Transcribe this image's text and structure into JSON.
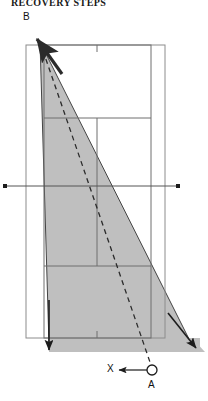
{
  "title": "RECOVERY STEPS",
  "labels": {
    "apex": "B",
    "pivot": "A",
    "axis_direction": "X"
  },
  "colors": {
    "shaded_fill": "#bfbfbf",
    "outline": "#3a3a3a",
    "thin_rule": "#8c8c8c",
    "dashed": "#2b2b2b",
    "text": "#111111"
  },
  "diagram": {
    "type": "tipping-geometry",
    "outer_rect": {
      "x1": 26,
      "y1": 45,
      "x2": 165,
      "y2": 338
    },
    "inner_rect": {
      "x1": 44,
      "y1": 45,
      "x2": 151,
      "y2": 338
    },
    "horizontal_dividers": [
      118,
      266
    ],
    "vertical_divider": 97,
    "tick_marks": [
      {
        "x": 97,
        "y": 45,
        "len": 6,
        "dir": "down"
      },
      {
        "x": 97,
        "y": 338,
        "len": 6,
        "dir": "up"
      }
    ],
    "axis_line": {
      "y": 186,
      "x1": 5,
      "x2": 178,
      "endpoint_style": "square-dot"
    },
    "shaded_triangle": [
      [
        40,
        42
      ],
      [
        49,
        345
      ],
      [
        192,
        345
      ]
    ],
    "bottom_band": {
      "x1": 49,
      "y1": 338,
      "x2": 200,
      "y2": 352
    },
    "dashed_path": [
      [
        40,
        42
      ],
      [
        152,
        370
      ]
    ],
    "pivot_circle": {
      "cx": 152,
      "cy": 370,
      "r": 5
    },
    "arrows": [
      {
        "name": "apex-arrow",
        "from": [
          60,
          70
        ],
        "to": [
          36,
          38
        ]
      },
      {
        "name": "left-down-arrow",
        "from": [
          49,
          318
        ],
        "to": [
          49,
          352
        ]
      },
      {
        "name": "right-down-arrow",
        "from": [
          170,
          318
        ],
        "to": [
          196,
          350
        ]
      },
      {
        "name": "x-direction-arrow",
        "from": [
          147,
          370
        ],
        "to": [
          118,
          370
        ]
      }
    ]
  }
}
